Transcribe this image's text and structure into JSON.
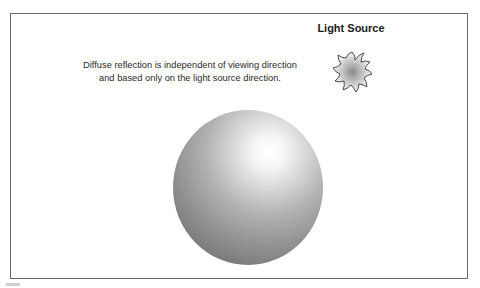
{
  "diagram": {
    "title": "Light Source",
    "caption_line1": "Diffuse reflection is independent of viewing direction",
    "caption_line2": "and based only on the light source direction.",
    "elements": [
      {
        "name": "light-source",
        "icon": "sun-icon"
      },
      {
        "name": "sphere",
        "shading": "diffuse"
      }
    ],
    "colors": {
      "border": "#6a6a6a",
      "text": "#2a2a2a",
      "sphere_highlight": "#ffffff",
      "sphere_shadow": "#5f5f5f"
    }
  }
}
